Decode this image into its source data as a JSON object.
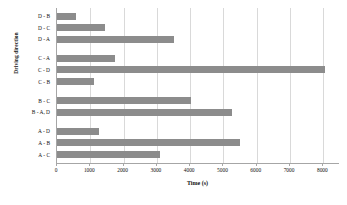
{
  "chart_data": {
    "type": "bar",
    "orientation": "horizontal",
    "title": "",
    "xlabel": "Time (s)",
    "ylabel": "Driving direction",
    "xlim": [
      0,
      8500
    ],
    "xticks": [
      0,
      1000,
      2000,
      3000,
      4000,
      5000,
      6000,
      7000,
      8000
    ],
    "xtick_labels": [
      "0",
      "1000",
      "2000",
      "3000",
      "4000",
      "5000",
      "6000",
      "7000",
      "8000"
    ],
    "grid": "vertical",
    "legend": "none",
    "bar_color": "#8c8c8c",
    "gridline_color": "#d9d9d9",
    "axis_color": "#a6a6a6",
    "groups": [
      {
        "name": "D",
        "categories": [
          "D - B",
          "D - C",
          "D - A"
        ],
        "values": [
          570,
          1450,
          3500
        ]
      },
      {
        "name": "C",
        "categories": [
          "C - A",
          "C - D",
          "C - B"
        ],
        "values": [
          1750,
          8050,
          1100
        ]
      },
      {
        "name": "B",
        "categories": [
          "B - C",
          "B - A, D"
        ],
        "values": [
          4020,
          5250
        ]
      },
      {
        "name": "A",
        "categories": [
          "A - D",
          "A - B",
          "A - C"
        ],
        "values": [
          1250,
          5500,
          3080
        ]
      }
    ],
    "categories": [
      "D - B",
      "D - C",
      "D - A",
      "C - A",
      "C - D",
      "C - B",
      "B - C",
      "B - A, D",
      "A - D",
      "A - B",
      "A - C"
    ],
    "values": [
      570,
      1450,
      3500,
      1750,
      8050,
      1100,
      4020,
      5250,
      1250,
      5500,
      3080
    ]
  }
}
